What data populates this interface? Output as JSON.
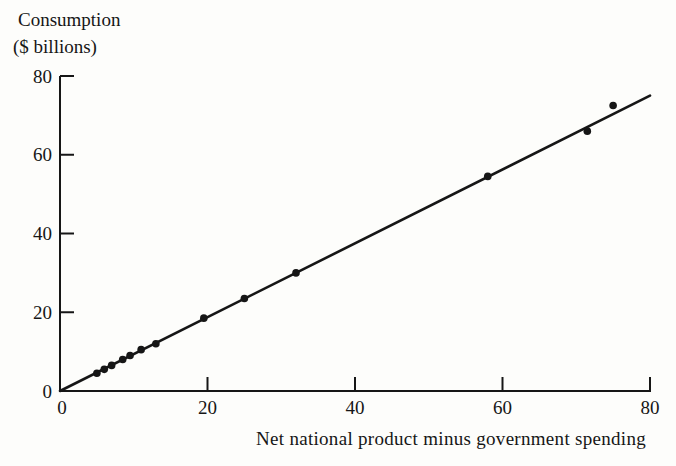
{
  "figure": {
    "background": "#fdfdfb",
    "ink_color": "#161616"
  },
  "chart_data": {
    "type": "scatter",
    "title_line1": "Consumption",
    "title_line2": "($ billions)",
    "ylabel": "Consumption ($ billions)",
    "xlabel": "Net national product minus government spending",
    "xlim": [
      0,
      80
    ],
    "ylim": [
      0,
      80
    ],
    "x_ticks": [
      0,
      20,
      40,
      60,
      80
    ],
    "y_ticks": [
      0,
      20,
      40,
      60,
      80
    ],
    "grid": false,
    "legend": "none",
    "marker": "filled-circle",
    "points": [
      {
        "x": 5,
        "y": 4.5
      },
      {
        "x": 6,
        "y": 5.5
      },
      {
        "x": 7,
        "y": 6.5
      },
      {
        "x": 8.5,
        "y": 8
      },
      {
        "x": 9.5,
        "y": 9
      },
      {
        "x": 11,
        "y": 10.5
      },
      {
        "x": 13,
        "y": 12
      },
      {
        "x": 19.5,
        "y": 18.5
      },
      {
        "x": 25,
        "y": 23.5
      },
      {
        "x": 32,
        "y": 30
      },
      {
        "x": 58,
        "y": 54.5
      },
      {
        "x": 71.5,
        "y": 66
      },
      {
        "x": 75,
        "y": 72.5
      }
    ],
    "trend_line": {
      "x1": 0,
      "y1": 0,
      "x2": 80,
      "y2": 75
    }
  }
}
